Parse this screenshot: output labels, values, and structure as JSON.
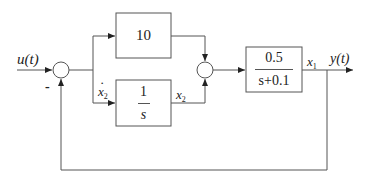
{
  "diagram": {
    "type": "block-diagram",
    "input": {
      "label": "u(t)"
    },
    "output": {
      "label": "y(t)"
    },
    "summing_junctions": [
      {
        "id": "sum1",
        "signs": {
          "left": "+",
          "bottom": "-"
        },
        "minus_label": "-"
      },
      {
        "id": "sum2",
        "signs": {
          "top": "+",
          "bottom": "+"
        }
      }
    ],
    "blocks": [
      {
        "id": "gain",
        "text": "10"
      },
      {
        "id": "integrator",
        "numerator": "1",
        "denominator": "s"
      },
      {
        "id": "plant",
        "numerator": "0.5",
        "denominator": "s+0.1"
      }
    ],
    "signals": {
      "integrator_input": {
        "base": "x",
        "sub": "2",
        "dot": "·"
      },
      "integrator_output": {
        "base": "x",
        "sub": "2"
      },
      "plant_output": {
        "base": "x",
        "sub": "1"
      }
    },
    "colors": {
      "line": "#555555",
      "text": "#222222",
      "background": "#ffffff"
    }
  }
}
